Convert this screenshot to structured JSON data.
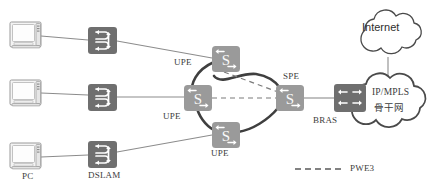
{
  "diagram": {
    "colors": {
      "line": "#8c8c8c",
      "cloud_stroke": "#4a4a4a",
      "router_fill": "#9a9a9a",
      "switch_fill": "#6f6f6f",
      "bras_fill": "#6f6f6f",
      "pc_fill": "#f2f2f2",
      "text": "#3c3c3c"
    },
    "nodes": [
      {
        "id": "pc1",
        "type": "pc-icon",
        "label": "",
        "x": 10,
        "y": 22
      },
      {
        "id": "pc2",
        "type": "pc-icon",
        "label": "",
        "x": 10,
        "y": 80
      },
      {
        "id": "pc3",
        "type": "pc-icon",
        "label": "PC",
        "x": 10,
        "y": 143
      },
      {
        "id": "dslam1",
        "type": "dslam-icon",
        "label": "",
        "x": 88,
        "y": 27
      },
      {
        "id": "dslam2",
        "type": "dslam-icon",
        "label": "",
        "x": 88,
        "y": 84
      },
      {
        "id": "dslam3",
        "type": "dslam-icon",
        "label": "DSLAM",
        "x": 88,
        "y": 144
      },
      {
        "id": "upe_top",
        "type": "router-icon",
        "label": "UPE",
        "x": 212,
        "y": 46
      },
      {
        "id": "upe_mid",
        "type": "router-icon",
        "label": "UPE",
        "x": 184,
        "y": 85
      },
      {
        "id": "upe_bot",
        "type": "router-icon",
        "label": "UPE",
        "x": 212,
        "y": 122
      },
      {
        "id": "spe",
        "type": "router-icon",
        "label": "SPE",
        "x": 276,
        "y": 85
      },
      {
        "id": "bras",
        "type": "bras-icon",
        "label": "BRAS",
        "x": 334,
        "y": 85
      },
      {
        "id": "internet_cloud",
        "type": "cloud",
        "label": "Internet",
        "x": 388,
        "y": 27
      },
      {
        "id": "backbone_cloud",
        "type": "cloud",
        "label": "IP/MPLS",
        "x": 388,
        "y": 95
      }
    ],
    "labels": {
      "upe_top": "UPE",
      "upe_mid": "UPE",
      "upe_bot": "UPE",
      "spe": "SPE",
      "bras": "BRAS",
      "pc": "PC",
      "dslam": "DSLAM",
      "internet": "Internet",
      "backbone_line1": "IP/MPLS",
      "backbone_line2": "骨干网"
    },
    "legend": {
      "pwe3_label": "PWE3",
      "line_style": "dashed"
    },
    "links": [
      {
        "from": "pc1",
        "to": "dslam1",
        "style": "solid"
      },
      {
        "from": "dslam1",
        "to": "upe_top",
        "style": "solid"
      },
      {
        "from": "pc2",
        "to": "dslam2",
        "style": "solid"
      },
      {
        "from": "dslam2",
        "to": "upe_mid",
        "style": "solid"
      },
      {
        "from": "pc3",
        "to": "dslam3",
        "style": "solid"
      },
      {
        "from": "dslam3",
        "to": "upe_bot",
        "style": "solid"
      },
      {
        "from": "upe_mid",
        "to": "spe",
        "style": "dashed",
        "note": "PWE3"
      },
      {
        "from": "upe_top",
        "to": "spe",
        "style": "dashed",
        "note": "PWE3"
      },
      {
        "from": "spe",
        "to": "bras",
        "style": "solid"
      },
      {
        "from": "bras",
        "to": "backbone_cloud",
        "style": "solid"
      },
      {
        "from": "backbone_cloud",
        "to": "internet_cloud",
        "style": "solid"
      }
    ]
  }
}
